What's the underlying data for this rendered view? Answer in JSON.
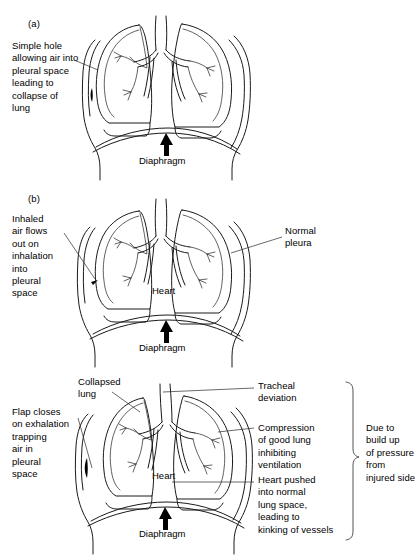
{
  "figure": {
    "ink_color": "#1a1a1a",
    "background_color": "#ffffff"
  },
  "panel_a": {
    "label": "(a)",
    "left_note": "Simple hole\nallowing air into\npleural space\nleading to\ncollapse of\nlung",
    "diaphragm_label": "Diaphragm"
  },
  "panel_b": {
    "label": "(b)",
    "left_note": "Inhaled\nair flows\nout on\ninhalation\ninto\npleural\nspace",
    "right_note": "Normal\npleura",
    "heart_label": "Heart",
    "diaphragm_label": "Diaphragm"
  },
  "panel_c": {
    "label": "",
    "collapsed_lung_label": "Collapsed\nlung",
    "left_note": "Flap closes\non exhalation\ntrapping\nair in\npleural\nspace",
    "tracheal_note": "Tracheal\ndeviation",
    "compression_note": "Compression\nof good lung\ninhibiting\nventilation",
    "heart_label": "Heart",
    "heart_note": "Heart pushed\ninto normal\nlung space,\nleading to\nkinking of vessels",
    "brace_note": "Due to\nbuild up\nof pressure\nfrom\ninjured side",
    "diaphragm_label": "Diaphragm"
  }
}
